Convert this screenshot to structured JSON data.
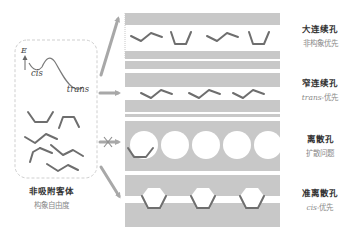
{
  "left_panel": {
    "energy_axis_label": "E",
    "cis_label": "cis",
    "trans_label": "trans",
    "title": "非吸附客体",
    "subtitle": "构象自由度"
  },
  "pores": [
    {
      "id": "large-continuous",
      "title": "大连续孔",
      "subtitle_prefix": "",
      "subtitle": "非构象优先",
      "arrow": "normal"
    },
    {
      "id": "narrow-continuous",
      "title": "窄连续孔",
      "subtitle_prefix": "trans",
      "subtitle": "-优先",
      "arrow": "normal"
    },
    {
      "id": "discrete",
      "title": "离散孔",
      "subtitle_prefix": "",
      "subtitle": "扩散问题",
      "arrow": "blocked"
    },
    {
      "id": "quasi-discrete",
      "title": "准离散孔",
      "subtitle_prefix": "cis",
      "subtitle": "-优先",
      "arrow": "normal"
    }
  ],
  "colors": {
    "wall": "#c8c8c8",
    "wall_edge": "#b4b4b4",
    "molecule": "#6e6e6e",
    "arrow": "#a8a8a8",
    "dashed_box": "#cfcfcf",
    "curve": "#7a7a7a"
  }
}
